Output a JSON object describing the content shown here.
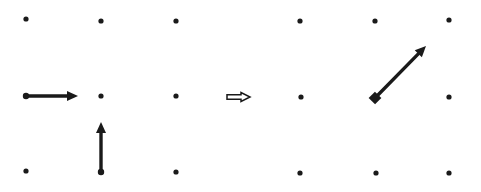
{
  "diagram": {
    "background": "#ffffff",
    "ink": "#1a1a1a",
    "left_grid": {
      "dots": [
        [
          26,
          19
        ],
        [
          101,
          21
        ],
        [
          176,
          21
        ],
        [
          26,
          96
        ],
        [
          101,
          96
        ],
        [
          176,
          96
        ],
        [
          26,
          171
        ],
        [
          101,
          172
        ],
        [
          176,
          172
        ]
      ]
    },
    "right_grid": {
      "dots": [
        [
          300,
          21
        ],
        [
          375,
          21
        ],
        [
          449,
          20
        ],
        [
          301,
          97
        ],
        [
          375,
          97
        ],
        [
          449,
          97
        ],
        [
          300,
          173
        ],
        [
          376,
          173
        ],
        [
          449,
          173
        ]
      ]
    },
    "arrows": [
      {
        "name": "horizontal-arrow",
        "from": [
          26,
          96
        ],
        "to": [
          78,
          96
        ],
        "style": "solid"
      },
      {
        "name": "vertical-arrow",
        "from": [
          101,
          172
        ],
        "to": [
          101,
          122
        ],
        "style": "solid"
      },
      {
        "name": "transform-arrow",
        "from": [
          227,
          97
        ],
        "to": [
          250,
          97
        ],
        "style": "hollow"
      },
      {
        "name": "diagonal-arrow",
        "from": [
          375,
          98
        ],
        "to": [
          426,
          46
        ],
        "style": "solid",
        "tail": "square"
      }
    ]
  }
}
